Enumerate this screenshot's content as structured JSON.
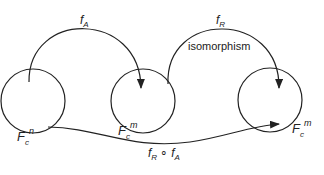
{
  "diagram": {
    "stroke_color": "#222222",
    "background": "#ffffff",
    "nodes": [
      {
        "id": "Fcn",
        "label_main": "F",
        "label_sub": "c",
        "label_sup": "n"
      },
      {
        "id": "Fcm_1",
        "label_main": "F",
        "label_sub": "c",
        "label_sup": "m"
      },
      {
        "id": "Fcm_2",
        "label_main": "F",
        "label_sub": "c",
        "label_sup": "m"
      }
    ],
    "edges": [
      {
        "from": "Fcn",
        "to": "Fcm_1",
        "label_main": "f",
        "label_sub": "A"
      },
      {
        "from": "Fcm_1",
        "to": "Fcm_2",
        "label_main": "f",
        "label_sub": "R",
        "annotation": "isomorphism"
      },
      {
        "from": "Fcn",
        "to": "Fcm_2",
        "label_main": "f",
        "label_sub_1": "R",
        "compose": "∘",
        "label_main_2": "f",
        "label_sub_2": "A"
      }
    ]
  }
}
